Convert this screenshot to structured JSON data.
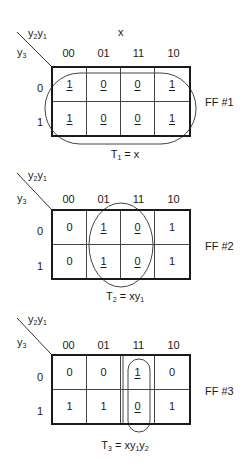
{
  "maps": [
    {
      "id": "map1",
      "top_var_label": "y2y1",
      "side_var_label": "y3",
      "input_label": "x",
      "columns": [
        "00",
        "01",
        "11",
        "10"
      ],
      "rows": [
        "0",
        "1"
      ],
      "cells": [
        [
          {
            "v": "1",
            "u": true
          },
          {
            "v": "0",
            "u": true
          },
          {
            "v": "0",
            "u": true
          },
          {
            "v": "1",
            "u": true
          }
        ],
        [
          {
            "v": "1",
            "u": true
          },
          {
            "v": "0",
            "u": true
          },
          {
            "v": "0",
            "u": true
          },
          {
            "v": "1",
            "u": true
          }
        ]
      ],
      "ff_label": "FF #1",
      "equation": {
        "lhs": "T",
        "lhs_sub": "1",
        "rhs": "= x"
      }
    },
    {
      "id": "map2",
      "top_var_label": "y2y1",
      "side_var_label": "y3",
      "columns": [
        "00",
        "01",
        "11",
        "10"
      ],
      "rows": [
        "0",
        "1"
      ],
      "cells": [
        [
          {
            "v": "0",
            "u": false
          },
          {
            "v": "1",
            "u": true
          },
          {
            "v": "0",
            "u": true
          },
          {
            "v": "1",
            "u": false
          }
        ],
        [
          {
            "v": "0",
            "u": false
          },
          {
            "v": "1",
            "u": true
          },
          {
            "v": "0",
            "u": true
          },
          {
            "v": "1",
            "u": false
          }
        ]
      ],
      "ff_label": "FF #2",
      "equation": {
        "lhs": "T",
        "lhs_sub": "2",
        "rhs": "= xy1"
      }
    },
    {
      "id": "map3",
      "top_var_label": "y2y1",
      "side_var_label": "y3",
      "columns": [
        "00",
        "01",
        "11",
        "10"
      ],
      "rows": [
        "0",
        "1"
      ],
      "cells": [
        [
          {
            "v": "0",
            "u": false
          },
          {
            "v": "0",
            "u": false
          },
          {
            "v": "1",
            "u": true
          },
          {
            "v": "0",
            "u": false
          }
        ],
        [
          {
            "v": "1",
            "u": false
          },
          {
            "v": "1",
            "u": false
          },
          {
            "v": "0",
            "u": true
          },
          {
            "v": "1",
            "u": false
          }
        ]
      ],
      "ff_label": "FF #3",
      "equation": {
        "lhs": "T",
        "lhs_sub": "3",
        "rhs": "= xy1y2"
      }
    }
  ],
  "labels": {
    "y": "y",
    "y_sub1": "1",
    "y_sub2": "2",
    "y_sub3": "3",
    "x": "x",
    "m1": {
      "ff": "FF #1",
      "eq_T": "T",
      "eq_sub": "1",
      "eq_rhs": " = x"
    },
    "m2": {
      "ff": "FF #2",
      "eq_T": "T",
      "eq_sub": "2",
      "eq_rhs_a": " = xy",
      "eq_rhs_sub": "1"
    },
    "m3": {
      "ff": "FF #3",
      "eq_T": "T",
      "eq_sub": "3",
      "eq_rhs_a": " = xy",
      "eq_rhs_sub1": "1",
      "eq_rhs_b": "y",
      "eq_rhs_sub2": "2"
    },
    "cols": [
      "00",
      "01",
      "11",
      "10"
    ],
    "rows": [
      "0",
      "1"
    ]
  }
}
